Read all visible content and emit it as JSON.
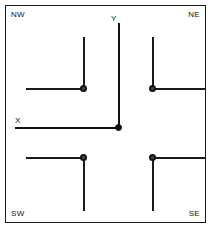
{
  "figure": {
    "title": "",
    "width": 213,
    "height": 230,
    "background_color": "#ffffff",
    "frame_color": "#1a1a1a",
    "line_color": "#1a1a1a",
    "vertex_fill_color": "#4d4d4d",
    "vertex_stroke_color": "#111111",
    "origin_color": "#111111"
  },
  "axes": {
    "x_label": "X",
    "y_label": "Y",
    "origin_label": ""
  },
  "quadrants": [
    {
      "key": "nw",
      "label": "NW",
      "arm_horizontal": "left",
      "arm_vertical": "up"
    },
    {
      "key": "ne",
      "label": "NE",
      "arm_horizontal": "right",
      "arm_vertical": "up"
    },
    {
      "key": "sw",
      "label": "SW",
      "arm_horizontal": "left",
      "arm_vertical": "down"
    },
    {
      "key": "se",
      "label": "SE",
      "arm_horizontal": "right",
      "arm_vertical": "down"
    }
  ]
}
